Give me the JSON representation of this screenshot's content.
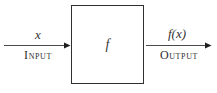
{
  "diagram": {
    "box": {
      "label": "f"
    },
    "input": {
      "value_label": "x",
      "caption": "Input"
    },
    "output": {
      "value_label": "f(x)",
      "caption": "Output"
    },
    "colors": {
      "background": "#ffffff",
      "box_border": "#2f2f2f",
      "arrow_line": "#4a4a4a",
      "arrow_head": "#1f1f1f",
      "text": "#2e2e2e"
    }
  }
}
